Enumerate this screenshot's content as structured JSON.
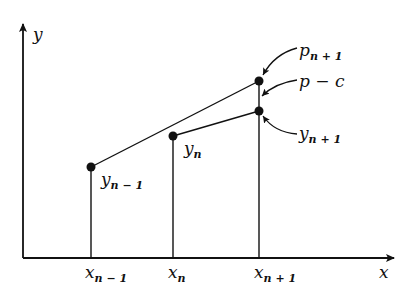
{
  "diagram": {
    "axes": {
      "x_label": "x",
      "y_label": "y"
    },
    "x_ticks": [
      {
        "base": "x",
        "sub": "n − 1"
      },
      {
        "base": "x",
        "sub": "n"
      },
      {
        "base": "x",
        "sub": "n + 1"
      }
    ],
    "points": [
      {
        "id": "y_n_minus_1",
        "base": "y",
        "sub": "n − 1"
      },
      {
        "id": "y_n",
        "base": "y",
        "sub": "n"
      },
      {
        "id": "p_n_plus_1",
        "base": "p",
        "sub": "n + 1"
      },
      {
        "id": "y_n_plus_1",
        "base": "y",
        "sub": "n + 1"
      }
    ],
    "annotations": {
      "p_minus_c": "p − c"
    },
    "colors": {
      "ink": "#111111",
      "background": "#ffffff"
    }
  }
}
